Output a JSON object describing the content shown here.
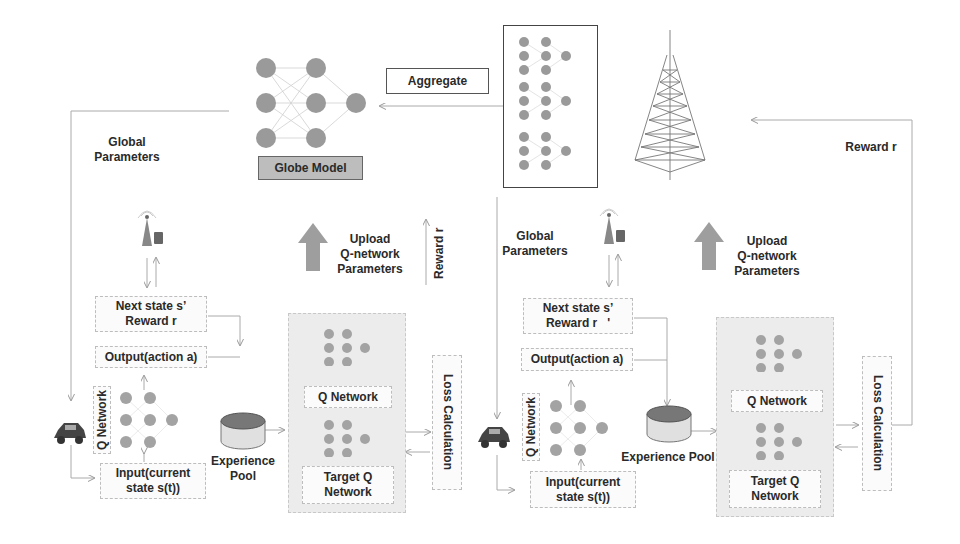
{
  "global_model": {
    "label": "Globe Model",
    "aggregate_label": "Aggregate"
  },
  "left": {
    "global_parameters": [
      "Global",
      "Parameters"
    ],
    "upload": [
      "Upload",
      "Q-network",
      "Parameters"
    ],
    "reward_vertical": "Reward r",
    "next_state": [
      "Next state s’",
      "Reward r"
    ],
    "output": "Output(action a)",
    "q_network_vertical": "Q Network",
    "input": [
      "Input(current",
      "state s(t))"
    ],
    "experience_pool": "Experience Pool",
    "q_network": "Q Network",
    "target_q": [
      "Target Q",
      "Network"
    ],
    "loss": "Loss Calculation"
  },
  "right": {
    "global_parameters": [
      "Global",
      "Parameters"
    ],
    "upload": [
      "Upload",
      "Q-network",
      "Parameters"
    ],
    "reward": "Reward r",
    "next_state": [
      "Next state s’",
      "Reward r"
    ],
    "next_state_mark": "'",
    "output": "Output(action a)",
    "q_network_vertical": "Q Network",
    "input": [
      "Input(current",
      "state s(t))"
    ],
    "experience_pool": "Experience Pool",
    "q_network": "Q Network",
    "target_q": [
      "Target Q",
      "Network"
    ],
    "loss": "Loss Calculation"
  },
  "icons": {
    "tower": "transmission-tower",
    "car": "car",
    "base_station": "base-station-with-router",
    "database": "experience-pool-cylinder",
    "neural_net": "neural-network"
  },
  "colors": {
    "node": "#9a9a9a",
    "arrow_fill": "#9e9e9e",
    "panel": "#ececec",
    "globe_box": "#bdbdbd"
  }
}
